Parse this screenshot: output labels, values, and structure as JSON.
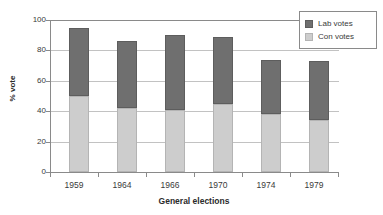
{
  "chart_data": {
    "type": "bar",
    "subtype": "stacked-bar",
    "title": "",
    "xlabel": "General elections",
    "ylabel": "% vote",
    "categories": [
      "1959",
      "1964",
      "1966",
      "1970",
      "1974",
      "1979"
    ],
    "series": [
      {
        "name": "Con votes",
        "color": "#cdcdcd",
        "values": [
          50,
          42,
          41,
          45,
          38,
          34
        ]
      },
      {
        "name": "Lab votes",
        "color": "#6f6f6f",
        "values": [
          45,
          44,
          49,
          44,
          36,
          39
        ]
      }
    ],
    "totals": [
      95,
      86,
      90,
      89,
      74,
      73
    ],
    "ylim": [
      0,
      100
    ],
    "yticks": [
      0,
      20,
      40,
      60,
      80,
      100
    ],
    "ytick_labels": [
      "0",
      "20",
      "40",
      "60",
      "80",
      "100"
    ],
    "grid": true,
    "grid_axis": "y",
    "legend": [
      "Lab votes",
      "Con votes"
    ],
    "legend_position": "top-right",
    "legend_border": true,
    "stack_order_bottom_to_top": [
      "Con votes",
      "Lab votes"
    ],
    "background": "#ffffff",
    "axis_color": "#8a8a8a",
    "gridline_color": "#c2c2c2"
  }
}
